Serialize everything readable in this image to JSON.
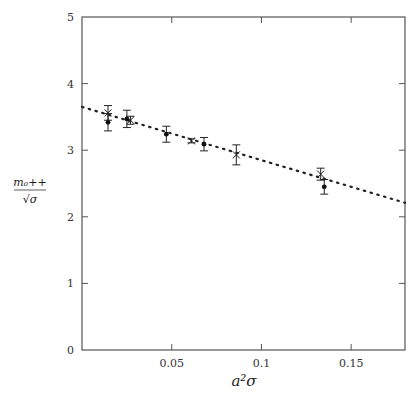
{
  "chart_data": {
    "type": "scatter",
    "title": "",
    "xlabel": "a²σ",
    "ylabel_numerator": "m₀++",
    "ylabel_denominator": "√σ",
    "xlim": [
      0,
      0.18
    ],
    "ylim": [
      0,
      5
    ],
    "x_ticks": [
      {
        "value": 0.05,
        "label": "0.05"
      },
      {
        "value": 0.1,
        "label": "0.1"
      },
      {
        "value": 0.15,
        "label": "0.15"
      }
    ],
    "y_ticks": [
      {
        "value": 0,
        "label": "0"
      },
      {
        "value": 1,
        "label": "1"
      },
      {
        "value": 2,
        "label": "2"
      },
      {
        "value": 3,
        "label": "3"
      },
      {
        "value": 4,
        "label": "4"
      },
      {
        "value": 5,
        "label": "5"
      }
    ],
    "grid": false,
    "legend": null,
    "series": [
      {
        "name": "dots",
        "marker": "filled-circle",
        "points": [
          {
            "x": 0.0145,
            "y": 3.42,
            "err": 0.13
          },
          {
            "x": 0.025,
            "y": 3.47,
            "err": 0.13
          },
          {
            "x": 0.047,
            "y": 3.24,
            "err": 0.12
          },
          {
            "x": 0.068,
            "y": 3.09,
            "err": 0.1
          },
          {
            "x": 0.135,
            "y": 2.45,
            "err": 0.11
          }
        ]
      },
      {
        "name": "crosses",
        "marker": "x-cross",
        "points": [
          {
            "x": 0.0145,
            "y": 3.56,
            "err": 0.11
          },
          {
            "x": 0.027,
            "y": 3.45,
            "err": 0.06
          },
          {
            "x": 0.061,
            "y": 3.14,
            "err": 0.03
          },
          {
            "x": 0.086,
            "y": 2.93,
            "err": 0.15
          },
          {
            "x": 0.133,
            "y": 2.64,
            "err": 0.09
          }
        ]
      },
      {
        "name": "fit",
        "style": "dotted-line",
        "points": [
          {
            "x": 0.0,
            "y": 3.65
          },
          {
            "x": 0.18,
            "y": 2.21
          }
        ]
      }
    ]
  }
}
